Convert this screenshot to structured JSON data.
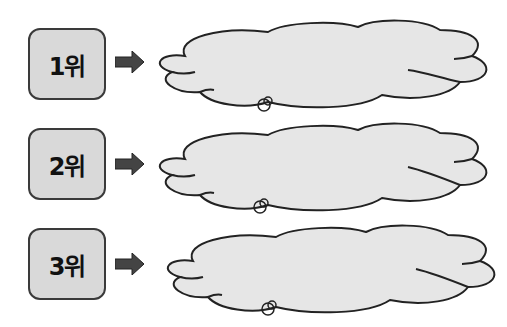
{
  "ranks": [
    {
      "label": "1위",
      "cloud_text": ""
    },
    {
      "label": "2위",
      "cloud_text": ""
    },
    {
      "label": "3위",
      "cloud_text": ""
    }
  ],
  "colors": {
    "box_fill": "#d9d9d9",
    "box_stroke": "#3a3a3a",
    "arrow_fill": "#444444",
    "cloud_fill": "#e6e6e6",
    "cloud_stroke": "#222222"
  },
  "icons": {
    "arrow": "arrow-right-icon",
    "cloud": "thought-cloud-icon"
  }
}
